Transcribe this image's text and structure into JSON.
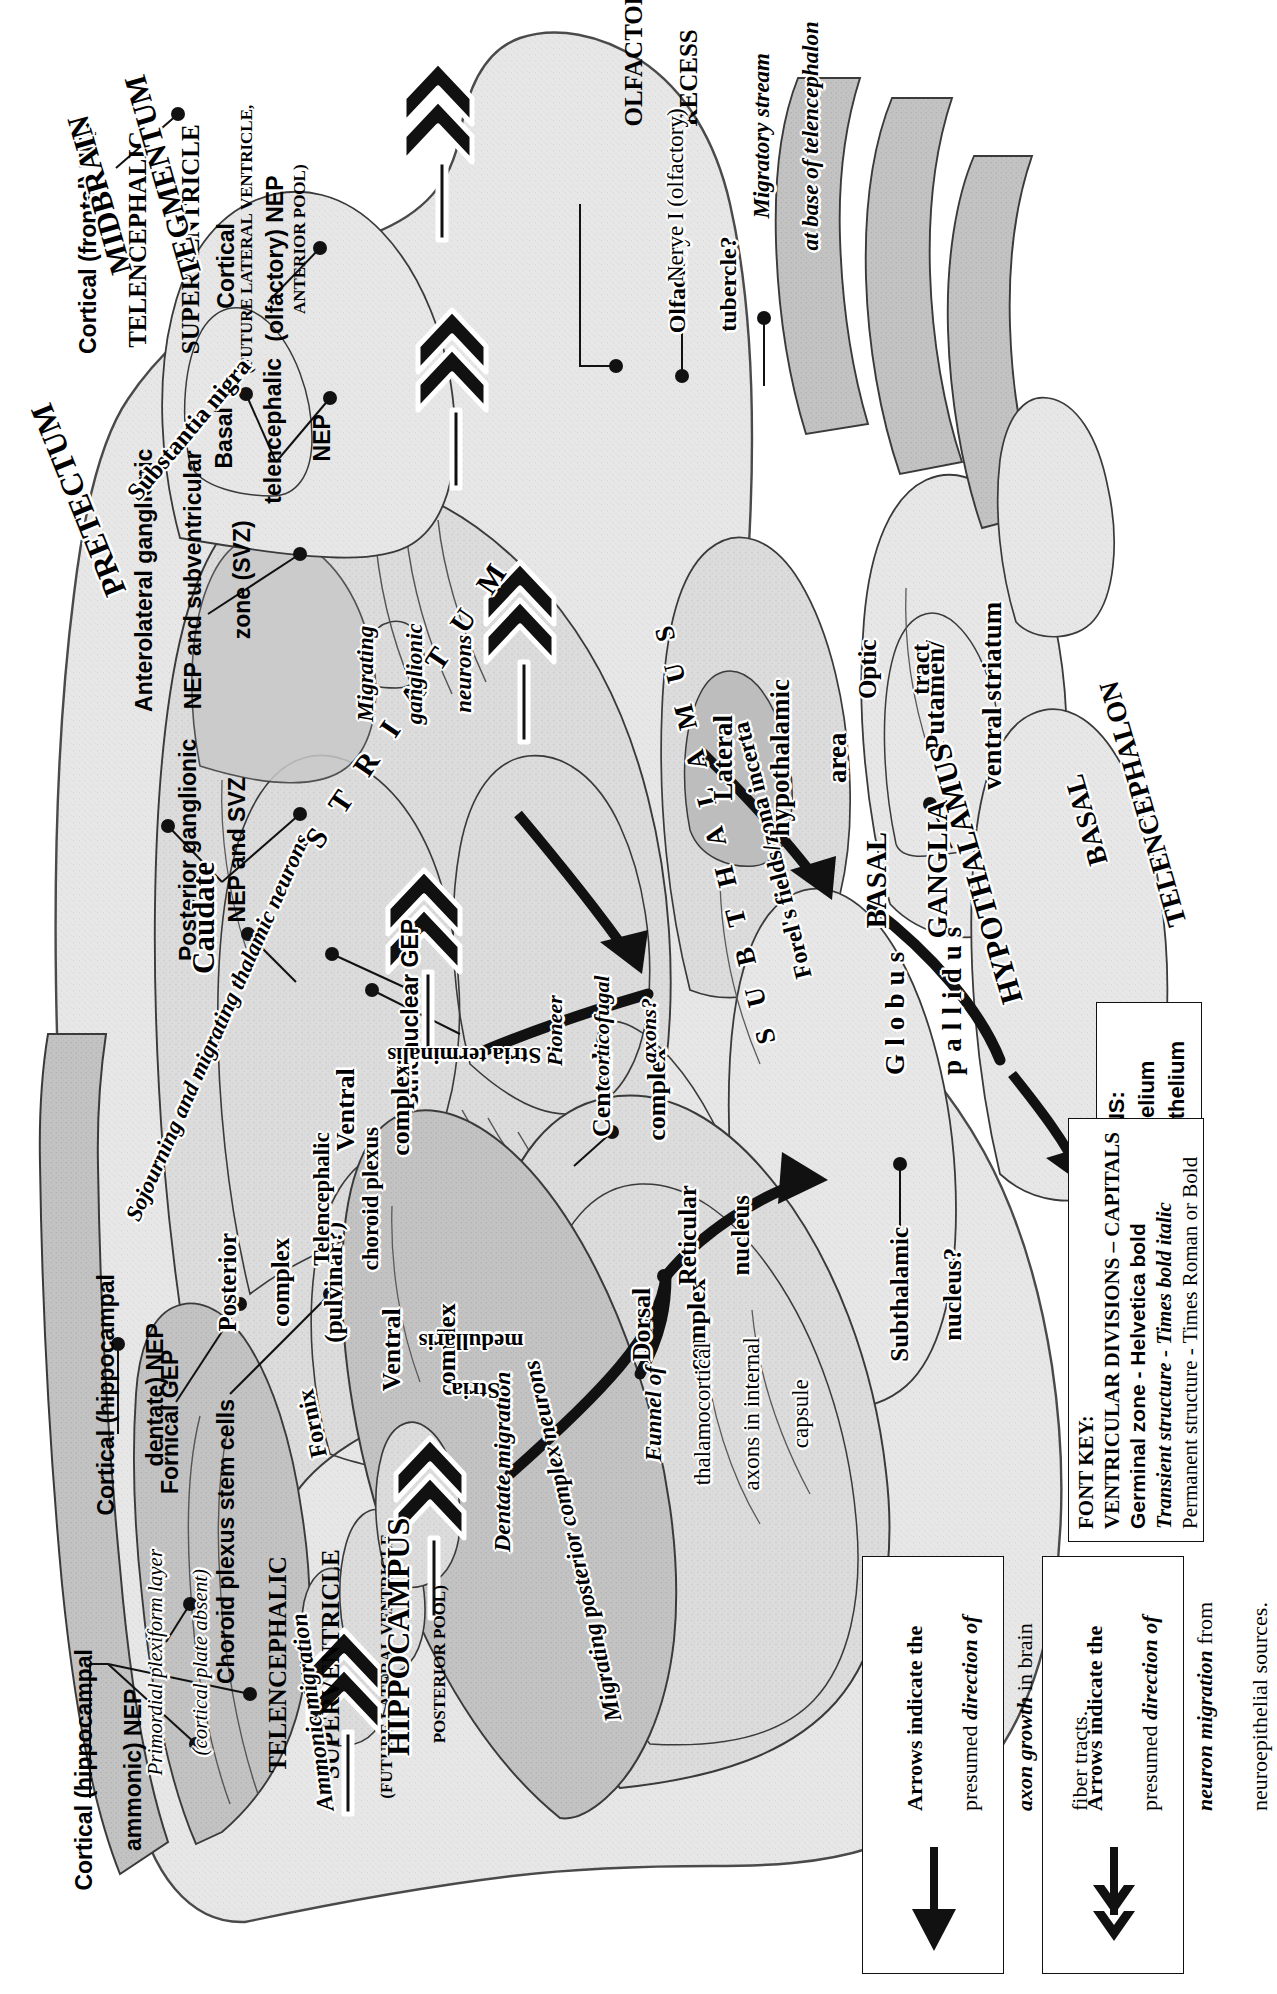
{
  "figure": {
    "orientation_note": "printed sideways (rotated 90 degrees)"
  },
  "ventricular_divisions": [
    {
      "name": "telencephalic-superventricle-posterior",
      "line1": "TELENCEPHALIC",
      "line2": "SUPERVENTRICLE",
      "line3": "(FUTURE LATERAL VENTRICLE,",
      "line4": "POSTERIOR POOL)"
    },
    {
      "name": "telencephalic-superventricle-anterior",
      "line1": "TELENCEPHALIC",
      "line2": "SUPERVENTRICLE",
      "line3": "(FUTURE LATERAL VENTRICLE,",
      "line4": "ANTERIOR POOL)"
    },
    {
      "name": "olfactory-recess",
      "line1": "OLFACTORY",
      "line2": "RECESS"
    }
  ],
  "germinal_zone_labels": [
    {
      "id": "cortical-hippocampal-ammonic-nep",
      "line1": "Cortical (hippocampal",
      "line2": "ammonic) NEP"
    },
    {
      "id": "cortical-hippocampal-dentate-nep",
      "line1": "Cortical (hippocampal",
      "line2": "dentate) NEP"
    },
    {
      "id": "fornical-gep",
      "line1": "Fornical GEP"
    },
    {
      "id": "choroid-plexus-stem-cells",
      "line1": "Choroid plexus stem cells"
    },
    {
      "id": "posterior-ganglionic-nep-svz",
      "line1": "Posterior ganglionic",
      "line2": "NEP and SVZ"
    },
    {
      "id": "anterolateral-ganglionic-nep-svz",
      "line1": "Anterolateral ganglionic",
      "line2": "NEP and subventricular",
      "line3": "zone (SVZ)"
    },
    {
      "id": "basal-telencephalic-nep",
      "line1": "Basal",
      "line2": "telencephalic",
      "line3": "NEP"
    },
    {
      "id": "cortical-olfactory-nep",
      "line1": "Cortical",
      "line2": "(olfactory) NEP"
    },
    {
      "id": "cortical-frontal-nep",
      "line1": "Cortical (frontal) NEP"
    },
    {
      "id": "strionuclear-gep",
      "line1": "Strionuclear GEP"
    }
  ],
  "structure_labels": [
    {
      "id": "hippocampus",
      "text": "HIPPOCAMPUS",
      "style": "bold-caps"
    },
    {
      "id": "fornix",
      "text": "Fornix",
      "style": "bold"
    },
    {
      "id": "ammonic-migration",
      "text": "Ammonic migration",
      "style": "bold-italic"
    },
    {
      "id": "dentate-migration",
      "text": "Dentate migration",
      "style": "bold-italic"
    },
    {
      "id": "primordial-plexiform",
      "line1": "Primordial plexiform layer",
      "line2": "(cortical plate absent)",
      "style": "italic"
    },
    {
      "id": "migrating-posterior-complex-neurons",
      "text": "Migrating posterior complex neurons",
      "style": "bold-italic"
    },
    {
      "id": "posterior-complex-pulvinar",
      "line1": "Posterior",
      "line2": "complex",
      "line3": "(pulvinar?)",
      "style": "bold"
    },
    {
      "id": "ventral-complex-1",
      "line1": "Ventral",
      "line2": "complex",
      "style": "bold"
    },
    {
      "id": "ventral-complex-2",
      "line1": "Ventral",
      "line2": "complex",
      "style": "bold"
    },
    {
      "id": "dorsal-complex",
      "line1": "Dorsal",
      "line2": "complex",
      "style": "bold"
    },
    {
      "id": "central-complex",
      "line1": "Central",
      "line2": "complex",
      "style": "bold"
    },
    {
      "id": "reticular-nucleus",
      "line1": "Reticular",
      "line2": "nucleus",
      "style": "bold"
    },
    {
      "id": "sojourning-migrating-thalamic-neurons",
      "text": "Sojourning and migrating thalamic neurons",
      "style": "bold-italic"
    },
    {
      "id": "subthalamus",
      "text": "S U B T H A L A M U S",
      "style": "bold-caps-spaced"
    },
    {
      "id": "forels-fields-zona-incerta",
      "text": "Forel's fields/zona incerta",
      "style": "bold"
    },
    {
      "id": "subthalamic-nucleus",
      "line1": "Subthalamic",
      "line2": "nucleus?",
      "style": "bold"
    },
    {
      "id": "substantia-nigra",
      "text": "Substantia nigra",
      "style": "bold"
    },
    {
      "id": "pretectum",
      "text": "PRETECTUM",
      "style": "bold-caps"
    },
    {
      "id": "midbrain-tegmentum",
      "line1": "MIDBRAIN",
      "line2": "TEGMENTUM",
      "style": "bold-caps"
    },
    {
      "id": "stria-medullaris",
      "line1": "Stria",
      "line2": "medullaris",
      "style": "bold"
    },
    {
      "id": "telencephalic-choroid-plexus",
      "line1": "Telencephalic",
      "line2": "choroid plexus",
      "style": "bold"
    },
    {
      "id": "caudate",
      "text": "Caudate",
      "style": "bold"
    },
    {
      "id": "striatum",
      "text": "S T R I A T U M",
      "style": "bold-caps-spaced"
    },
    {
      "id": "stria-terminalis",
      "text": "Stria terminalis",
      "style": "bold"
    },
    {
      "id": "migrating-ganglionic-neurons",
      "line1": "Migrating",
      "line2": "ganglionic",
      "line3": "neurons",
      "style": "bold-italic"
    },
    {
      "id": "funnel-thalamocortical-axons",
      "line1": "Funnel of",
      "line2": "thalamocortical",
      "line3": "axons in internal",
      "line4": "capsule",
      "style": "italic-first-word-bold"
    },
    {
      "id": "pioneer-corticofugal-axons",
      "line1": "Pioneer",
      "line2": "corticofugal",
      "line3": "axons?",
      "style": "bold-italic"
    },
    {
      "id": "basal-ganglia",
      "line1": "BASAL",
      "line2": "GANGLIA",
      "style": "bold-caps"
    },
    {
      "id": "globus-pallidus",
      "line1": "Globus",
      "line2": "pallidus",
      "style": "bold-spaced"
    },
    {
      "id": "putamen-ventral-striatum",
      "line1": "Putamen/",
      "line2": "ventral striatum",
      "style": "bold"
    },
    {
      "id": "basal-telencephalon",
      "line1": "BASAL",
      "line2": "TELENCEPHALON",
      "style": "bold-caps"
    },
    {
      "id": "lateral-hypothalamic-area",
      "line1": "Lateral",
      "line2": "hypothalamic",
      "line3": "area",
      "style": "bold"
    },
    {
      "id": "hypothalamus",
      "text": "HYPOTHALAMUS",
      "style": "bold-caps"
    },
    {
      "id": "optic-tract",
      "line1": "Optic",
      "line2": "tract",
      "style": "bold"
    },
    {
      "id": "olfactory-tubercle",
      "line1": "Olfactory",
      "line2": "tubercle?",
      "style": "bold"
    },
    {
      "id": "migratory-stream-base",
      "line1": "Migratory stream",
      "line2": "at base of telencephalon",
      "style": "bold-italic"
    },
    {
      "id": "nerve-i-olfactory",
      "text": "Nerve I (olfactory)",
      "style": "roman"
    }
  ],
  "abbreviations_box": {
    "title": "ABBREVIATIONS:",
    "items": [
      "GEP - Glioepithelium",
      "NEP - Neuroepithelium"
    ]
  },
  "font_key_box": {
    "title": "FONT KEY:",
    "lines": [
      "VENTRICULAR DIVISIONS – CAPITALS",
      "Germinal zone - Helvetica bold",
      "Transient structure - Times bold italic",
      "Permanent structure - Times Roman or Bold"
    ]
  },
  "legend_neuron_migration": {
    "icon": "double-chevron-arrow-left",
    "line1": "Arrows indicate the",
    "line2_pre": "presumed ",
    "line2_em": "direction of",
    "line3_em": "neuron migration",
    "line3_post": " from",
    "line4": "neuroepithelial sources."
  },
  "legend_axon_growth": {
    "icon": "solid-arrow-left",
    "line1": "Arrows indicate the",
    "line2_pre": "presumed ",
    "line2_em": "direction of",
    "line3_em": "axon growth",
    "line3_post": " in brain",
    "line4": "fiber tracts."
  },
  "colors": {
    "ink": "#111111",
    "paper": "#ffffff",
    "tissue_light": "#e9e9e9",
    "tissue_mid": "#d6d6d6",
    "germinal_dark": "#b9b9b9",
    "germinal_darker": "#a9a9a9"
  }
}
